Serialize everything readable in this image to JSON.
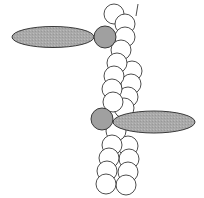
{
  "diagram": {
    "colors": {
      "background": "#ffffff",
      "stroke": "#3a3a3a",
      "subunit_fill": "#ffffff",
      "myosin_fill": "#a8a8a8",
      "myosin_head_fill": "#a0a0a0"
    },
    "myosin_motors": [
      {
        "id": "myosin-top",
        "tail": {
          "cx": 53,
          "cy": 37,
          "rx": 41,
          "ry": 10.5
        },
        "head": {
          "cx": 105,
          "cy": 37,
          "r": 11
        }
      },
      {
        "id": "myosin-bottom",
        "tail": {
          "cx": 154,
          "cy": 122,
          "rx": 41,
          "ry": 11
        },
        "head": {
          "cx": 102,
          "cy": 119,
          "r": 11
        }
      }
    ],
    "actin_strand_a": [
      {
        "cx": 114,
        "cy": 14,
        "r": 10
      },
      {
        "cx": 125,
        "cy": 24,
        "r": 10
      },
      {
        "cx": 125,
        "cy": 37,
        "r": 10
      },
      {
        "cx": 121,
        "cy": 50,
        "r": 10
      },
      {
        "cx": 117,
        "cy": 63,
        "r": 10
      },
      {
        "cx": 114,
        "cy": 76,
        "r": 10
      },
      {
        "cx": 112,
        "cy": 89,
        "r": 10
      },
      {
        "cx": 113,
        "cy": 102,
        "r": 10
      },
      {
        "cx": 116,
        "cy": 131,
        "r": 10
      },
      {
        "cx": 112,
        "cy": 145,
        "r": 10
      },
      {
        "cx": 109,
        "cy": 158,
        "r": 10
      },
      {
        "cx": 107,
        "cy": 171,
        "r": 10
      },
      {
        "cx": 106,
        "cy": 184,
        "r": 10
      }
    ],
    "actin_strand_b": [
      {
        "cx": 132,
        "cy": 71,
        "r": 10
      },
      {
        "cx": 131,
        "cy": 84,
        "r": 10
      },
      {
        "cx": 128,
        "cy": 97,
        "r": 10
      },
      {
        "cx": 124,
        "cy": 108,
        "r": 10
      },
      {
        "cx": 128,
        "cy": 146,
        "r": 10
      },
      {
        "cx": 129,
        "cy": 159,
        "r": 10
      },
      {
        "cx": 128,
        "cy": 172,
        "r": 10
      },
      {
        "cx": 126,
        "cy": 185,
        "r": 10
      }
    ],
    "strand_end_line": {
      "x1": 138,
      "y1": 4,
      "x2": 136,
      "y2": 16
    }
  }
}
